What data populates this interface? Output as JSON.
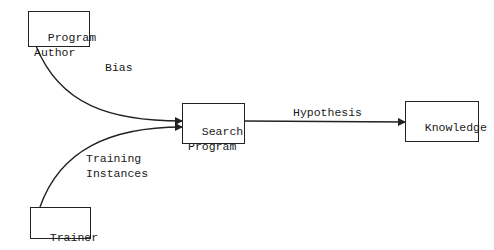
{
  "diagram": {
    "nodes": {
      "program_author": {
        "label": "Program\nAuthor"
      },
      "search_program": {
        "label": "Search\nProgram"
      },
      "knowledge": {
        "label": "Knowledge"
      },
      "trainer": {
        "label": "Trainer"
      }
    },
    "edges": {
      "bias": {
        "label": "Bias",
        "from": "Program Author",
        "to": "Search Program"
      },
      "training_instances": {
        "label": "Training\nInstances",
        "from": "Trainer",
        "to": "Search Program"
      },
      "hypothesis": {
        "label": "Hypothesis",
        "from": "Search Program",
        "to": "Knowledge"
      }
    },
    "colors": {
      "stroke": "#222222",
      "background": "#ffffff",
      "text": "#1a1a1a"
    }
  }
}
